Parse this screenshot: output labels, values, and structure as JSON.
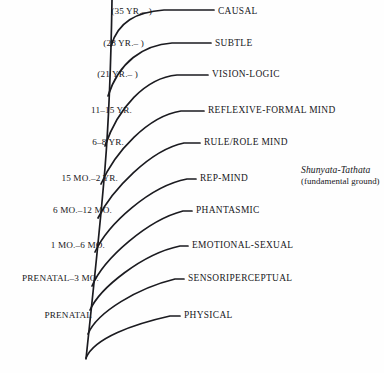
{
  "figure": {
    "type": "branching-tree-diagram",
    "background_color": "#fefefe",
    "line_color": "#1b1b20",
    "text_color": "#17171b"
  },
  "ground_note": {
    "title": "Shunyata-Tathata",
    "subtitle": "(fundamental ground)"
  },
  "levels": [
    {
      "age": "(35 YR.– )",
      "name": "CAUSAL",
      "age_right": 152,
      "label_left": 218,
      "y": 11
    },
    {
      "age": "(28 YR.– )",
      "name": "SUBTLE",
      "age_right": 144,
      "label_left": 215,
      "y": 43
    },
    {
      "age": "(21 YR.– )",
      "name": "VISION-LOGIC",
      "age_right": 138,
      "label_left": 212,
      "y": 74
    },
    {
      "age": "11–15 YR.",
      "name": "REFLEXIVE-FORMAL MIND",
      "age_right": 132,
      "label_left": 208,
      "y": 110
    },
    {
      "age": "6–8 YR.",
      "name": "RULE/ROLE MIND",
      "age_right": 124,
      "label_left": 204,
      "y": 142
    },
    {
      "age": "15 MO.–2 YR.",
      "name": "REP-MIND",
      "age_right": 118,
      "label_left": 200,
      "y": 178
    },
    {
      "age": "6 MO.–12 MO.",
      "name": "PHANTASMIC",
      "age_right": 112,
      "label_left": 196,
      "y": 210
    },
    {
      "age": "1 MO.–6 MO.",
      "name": "EMOTIONAL-SEXUAL",
      "age_right": 105,
      "label_left": 192,
      "y": 245
    },
    {
      "age": "PRENATAL–3 MO.",
      "name": "SENSORIPERCEPTUAL",
      "age_right": 99,
      "label_left": 188,
      "y": 278
    },
    {
      "age": "PRENATAL",
      "name": "PHYSICAL",
      "age_right": 92,
      "label_left": 184,
      "y": 315
    }
  ],
  "chart_data": {
    "type": "diagram",
    "title": "",
    "categories": [
      "PHYSICAL",
      "SENSORIPERCEPTUAL",
      "EMOTIONAL-SEXUAL",
      "PHANTASMIC",
      "REP-MIND",
      "RULE/ROLE MIND",
      "REFLEXIVE-FORMAL MIND",
      "VISION-LOGIC",
      "SUBTLE",
      "CAUSAL"
    ],
    "age_ranges": [
      "PRENATAL",
      "PRENATAL–3 MO.",
      "1 MO.–6 MO.",
      "6 MO.–12 MO.",
      "15 MO.–2 YR.",
      "6–8 YR.",
      "11–15 YR.",
      "(21 YR.– )",
      "(28 YR.– )",
      "(35 YR.– )"
    ],
    "annotations": [
      "Shunyata-Tathata",
      "(fundamental ground)"
    ],
    "legend": "none",
    "grid": false
  },
  "geometry": {
    "trunk_path": "M 86 359 C 90 320 99 240 105 168 C 109 118 111 62 112 0",
    "branches": [
      "M 111 46 C 118 22 136 12 164 10 L 214 10",
      "M 108 96 C 119 62 143 45 172 43 L 211 43",
      "M 105 146 C 118 108 145 78 177 75 L 208 75",
      "M 101 184 C 115 152 148 116 181 111 L 204 111",
      "M 98 218 C 112 190 150 150 184 143 L 200 143",
      "M 95 252 C 108 224 150 186 187 179 L 196 179",
      "M 92 286 C 104 258 148 220 183 211 L 192 211",
      "M 90 310 C 100 288 142 254 180 246 L 188 246",
      "M 88 334 C 97 312 138 288 175 279 L 184 279",
      "M 86 358 C 94 338 134 324 170 316 L 180 316"
    ]
  }
}
